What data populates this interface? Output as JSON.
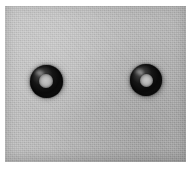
{
  "image": {
    "kind": "photograph",
    "subject": "two black rubber o-rings on gray card",
    "width_px": 193,
    "height_px": 169,
    "frame_color": "#ffffff",
    "backdrop_color": "#b9b9b9",
    "object_color": "#101010",
    "caption": ""
  },
  "backdrop": {
    "name": "gray textured card",
    "left_px": 5,
    "top_px": 6,
    "width_px": 181,
    "height_px": 156,
    "texture": "fine paper grain"
  },
  "objects": [
    {
      "name": "o-ring-left",
      "label": "",
      "center_x_px": 46,
      "center_y_px": 81,
      "outer_diameter_px": 33,
      "inner_diameter_px": 14,
      "color": "#101010",
      "hole_color": "#b4b4b4"
    },
    {
      "name": "o-ring-right",
      "label": "",
      "center_x_px": 146,
      "center_y_px": 80,
      "outer_diameter_px": 32,
      "inner_diameter_px": 13,
      "color": "#101010",
      "hole_color": "#b4b4b4"
    }
  ]
}
